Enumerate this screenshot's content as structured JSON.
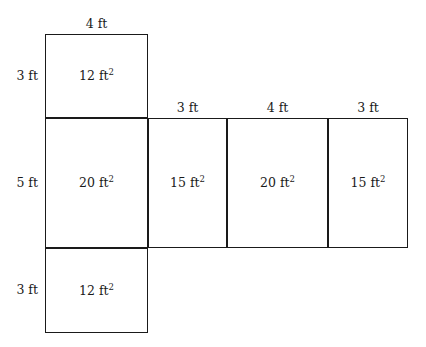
{
  "figure": {
    "type": "net-of-rectangular-prism",
    "unit": "ft",
    "area_unit": "ft2",
    "line_color": "#1a1a1a",
    "background_color": "#ffffff"
  },
  "faces": [
    {
      "id": "top-face",
      "name": "top-square",
      "area_label": "12 ft",
      "area_exponent": "2",
      "x": 45,
      "y": 34,
      "width": 103,
      "height": 84
    },
    {
      "id": "middle-face-1",
      "name": "middle-cell-1",
      "area_label": "20 ft",
      "area_exponent": "2",
      "x": 45,
      "y": 118,
      "width": 103,
      "height": 130
    },
    {
      "id": "middle-face-2",
      "name": "middle-cell-2",
      "area_label": "15 ft",
      "area_exponent": "2",
      "x": 148,
      "y": 118,
      "width": 79,
      "height": 130
    },
    {
      "id": "middle-face-3",
      "name": "middle-cell-3",
      "area_label": "20 ft",
      "area_exponent": "2",
      "x": 227,
      "y": 118,
      "width": 101,
      "height": 130
    },
    {
      "id": "middle-face-4",
      "name": "middle-cell-4",
      "area_label": "15 ft",
      "area_exponent": "2",
      "x": 328,
      "y": 118,
      "width": 80,
      "height": 130
    },
    {
      "id": "bottom-face",
      "name": "bottom-square",
      "area_label": "12 ft",
      "area_exponent": "2",
      "x": 45,
      "y": 248,
      "width": 103,
      "height": 85
    }
  ],
  "dimensions": {
    "top": [
      {
        "id": "dim-top-1",
        "name": "dimension-top-face-width",
        "label": "4 ft",
        "x": 45,
        "y": 30,
        "width": 103
      },
      {
        "id": "dim-top-2",
        "name": "dimension-middle-cell-2-width",
        "label": "3 ft",
        "x": 148,
        "y": 114,
        "width": 79
      },
      {
        "id": "dim-top-3",
        "name": "dimension-middle-cell-3-width",
        "label": "4 ft",
        "x": 227,
        "y": 114,
        "width": 101
      },
      {
        "id": "dim-top-4",
        "name": "dimension-middle-cell-4-width",
        "label": "3 ft",
        "x": 328,
        "y": 114,
        "width": 80
      }
    ],
    "left": [
      {
        "id": "dim-left-1",
        "name": "dimension-top-face-height",
        "label": "3 ft",
        "x": 6,
        "y": 76,
        "width": 32
      },
      {
        "id": "dim-left-2",
        "name": "dimension-middle-row-height",
        "label": "5 ft",
        "x": 6,
        "y": 183,
        "width": 32
      },
      {
        "id": "dim-left-3",
        "name": "dimension-bottom-face-height",
        "label": "3 ft",
        "x": 6,
        "y": 290,
        "width": 32
      }
    ]
  }
}
